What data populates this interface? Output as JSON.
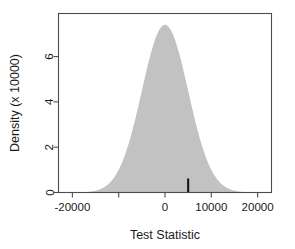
{
  "chart_data": {
    "type": "area",
    "title": "",
    "subtitle": "",
    "xlabel": "Test Statistic",
    "ylabel": "Density (x 10000)",
    "xlim": [
      -23000,
      23000
    ],
    "ylim": [
      0,
      7.9
    ],
    "grid": false,
    "legend": null,
    "xticks": [
      -20000,
      -10000,
      0,
      10000,
      20000
    ],
    "xtick_labels": [
      "-20000",
      "",
      "0",
      "10000",
      "20000"
    ],
    "yticks": [
      0,
      2,
      4,
      6
    ],
    "ytick_labels": [
      "0",
      "2",
      "4",
      "6"
    ],
    "series": [
      {
        "name": "Null distribution density",
        "kind": "filled-density",
        "fill_color": "#c2c2c2",
        "mean": 0,
        "sd": 5000,
        "peak_value": 7.4,
        "x": [
          -23000,
          -21000,
          -19000,
          -17000,
          -15000,
          -13000,
          -11000,
          -9000,
          -7000,
          -5000,
          -3000,
          -1000,
          0,
          1000,
          3000,
          5000,
          7000,
          9000,
          11000,
          13000,
          15000,
          17000,
          19000,
          21000,
          23000
        ],
        "values": [
          0.01,
          0.03,
          0.08,
          0.2,
          0.45,
          0.95,
          1.8,
          3.0,
          4.5,
          6.0,
          7.0,
          7.35,
          7.4,
          7.35,
          7.0,
          6.0,
          4.5,
          3.0,
          1.8,
          0.95,
          0.45,
          0.2,
          0.08,
          0.03,
          0.01
        ]
      }
    ],
    "annotations": [
      {
        "name": "observed-test-statistic",
        "kind": "vertical-line",
        "x": 5000,
        "y_start": 0,
        "y_end": 0.62,
        "color": "#161616"
      }
    ]
  },
  "figure": {
    "background_color": "#ffffff",
    "frame_color": "#4d4d4d",
    "text_color": "#1a1a1a"
  }
}
